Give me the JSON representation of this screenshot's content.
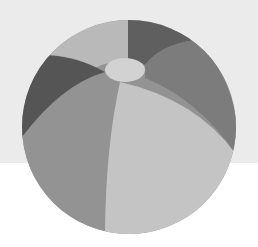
{
  "image": {
    "subject": "beach-ball",
    "description": "Grayscale beach ball illustration on a two-tone background"
  },
  "colors": {
    "background_top": "#ebebeb",
    "background_bottom": "#ffffff",
    "panel_top_left_light": "#b9b9b9",
    "panel_top_dark": "#5f5f5f",
    "panel_left_dark": "#555555",
    "panel_right_mid": "#7c7c7c",
    "panel_front_left": "#939393",
    "panel_front_right": "#c4c4c4",
    "cap": "#d2d2d2"
  }
}
